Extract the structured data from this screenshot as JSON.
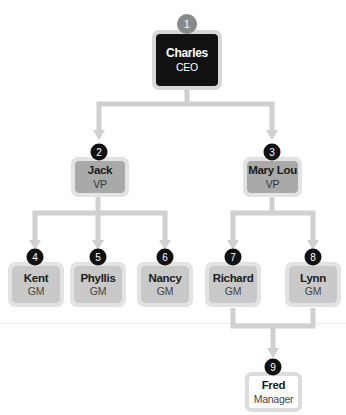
{
  "diagram": {
    "type": "org-chart",
    "colors": {
      "connector": "#d0d0d0",
      "ceo_fill": "#111111",
      "vp_fill": "#a9a9a9",
      "gm_fill": "#c9c9c9",
      "manager_fill": "#ffffff",
      "badge": "#111111",
      "top_badge": "#8a8a8a"
    },
    "nodes": [
      {
        "id": 1,
        "badge": "1",
        "name": "Charles",
        "title": "CEO",
        "parent": null
      },
      {
        "id": 2,
        "badge": "2",
        "name": "Jack",
        "title": "VP",
        "parent": 1
      },
      {
        "id": 3,
        "badge": "3",
        "name": "Mary Lou",
        "title": "VP",
        "parent": 1
      },
      {
        "id": 4,
        "badge": "4",
        "name": "Kent",
        "title": "GM",
        "parent": 2
      },
      {
        "id": 5,
        "badge": "5",
        "name": "Phyllis",
        "title": "GM",
        "parent": 2
      },
      {
        "id": 6,
        "badge": "6",
        "name": "Nancy",
        "title": "GM",
        "parent": 2
      },
      {
        "id": 7,
        "badge": "7",
        "name": "Richard",
        "title": "GM",
        "parent": 3
      },
      {
        "id": 8,
        "badge": "8",
        "name": "Lynn",
        "title": "GM",
        "parent": 3
      },
      {
        "id": 9,
        "badge": "9",
        "name": "Fred",
        "title": "Manager",
        "parent": [
          7,
          8
        ]
      }
    ]
  }
}
